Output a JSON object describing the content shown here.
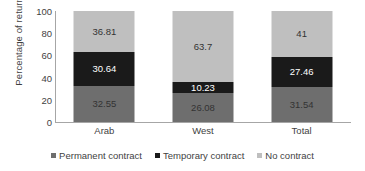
{
  "chart_data": {
    "type": "bar",
    "subtype": "stacked-100-percent",
    "title": "",
    "xlabel": "",
    "ylabel": "Percentage of returnees",
    "ylim": [
      0,
      100
    ],
    "yticks": [
      0,
      20,
      40,
      60,
      80,
      100
    ],
    "ytick_labels": [
      "0",
      "20",
      "40",
      "60",
      "80",
      "100"
    ],
    "grid": false,
    "legend_position": "bottom",
    "categories": [
      "Arab",
      "West",
      "Total"
    ],
    "series": [
      {
        "name": "Permanent contract",
        "color": "#6e6e6e",
        "label_color": "#333333",
        "values": [
          32.55,
          26.08,
          31.54
        ],
        "value_labels": [
          "32.55",
          "26.08",
          "31.54"
        ]
      },
      {
        "name": "Temporary contract",
        "color": "#1a1a1a",
        "label_color": "#ffffff",
        "values": [
          30.64,
          10.23,
          27.46
        ],
        "value_labels": [
          "30.64",
          "10.23",
          "27.46"
        ]
      },
      {
        "name": "No contract",
        "color": "#bfbfbf",
        "label_color": "#333333",
        "values": [
          36.81,
          63.7,
          41
        ],
        "value_labels": [
          "36.81",
          "63.7",
          "41"
        ]
      }
    ]
  },
  "axis": {
    "y_title": "Percentage of returnees",
    "axis_color": "#a6a6a6"
  }
}
